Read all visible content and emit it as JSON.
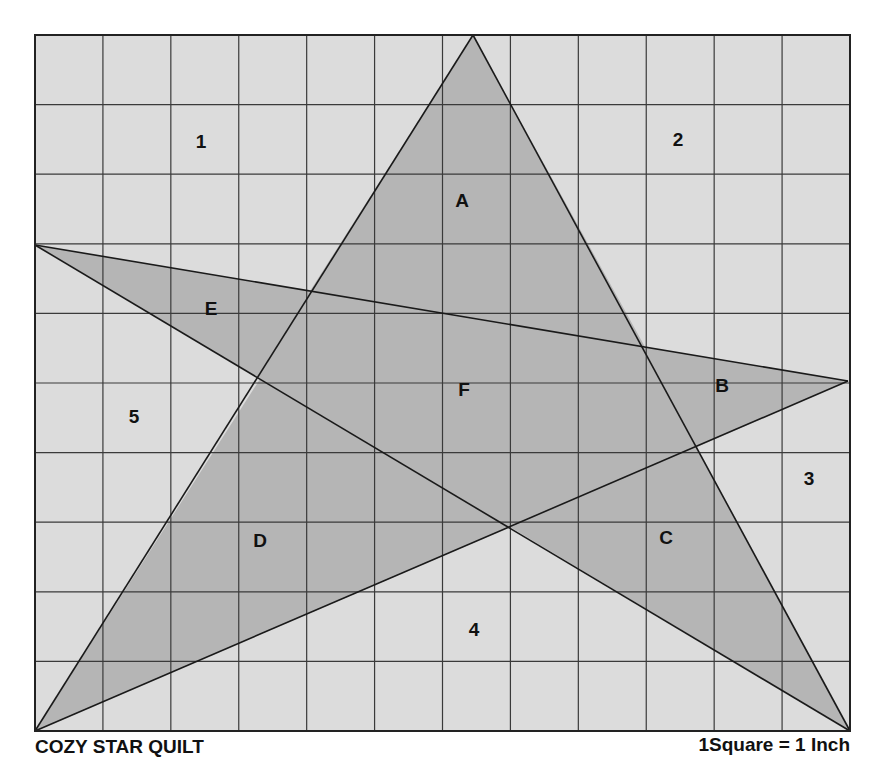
{
  "title": "COZY STAR QUILT",
  "scale_note": "1Square = 1 Inch",
  "colors": {
    "background": "#dcdcdc",
    "star_fill": "#b5b5b5",
    "grid_line": "#3a3a3a",
    "star_line": "#1a1a1a",
    "text": "#111111"
  },
  "grid": {
    "left": 35,
    "top": 35,
    "right": 850,
    "bottom": 731,
    "columns": 12,
    "rows": 10
  },
  "star": {
    "points": {
      "top": [
        473,
        35
      ],
      "left": [
        35,
        245
      ],
      "right": [
        848,
        381
      ],
      "bottom_left": [
        35,
        731
      ],
      "bottom_right": [
        850,
        731
      ]
    },
    "outline": [
      [
        473,
        35
      ],
      [
        645,
        347
      ],
      [
        848,
        381
      ],
      [
        697,
        447
      ],
      [
        850,
        731
      ],
      [
        510,
        527
      ],
      [
        35,
        731
      ],
      [
        260,
        379
      ],
      [
        35,
        245
      ],
      [
        310,
        291
      ]
    ]
  },
  "labels": [
    {
      "text": "1",
      "x": 201,
      "y": 148,
      "region": "background"
    },
    {
      "text": "2",
      "x": 678,
      "y": 146,
      "region": "background"
    },
    {
      "text": "3",
      "x": 809,
      "y": 485,
      "region": "background"
    },
    {
      "text": "4",
      "x": 474,
      "y": 636,
      "region": "background"
    },
    {
      "text": "5",
      "x": 134,
      "y": 423,
      "region": "background"
    },
    {
      "text": "A",
      "x": 462,
      "y": 207,
      "region": "star"
    },
    {
      "text": "B",
      "x": 722,
      "y": 392,
      "region": "star"
    },
    {
      "text": "C",
      "x": 666,
      "y": 544,
      "region": "star"
    },
    {
      "text": "D",
      "x": 260,
      "y": 547,
      "region": "star"
    },
    {
      "text": "E",
      "x": 211,
      "y": 315,
      "region": "star"
    },
    {
      "text": "F",
      "x": 464,
      "y": 396,
      "region": "star"
    }
  ]
}
